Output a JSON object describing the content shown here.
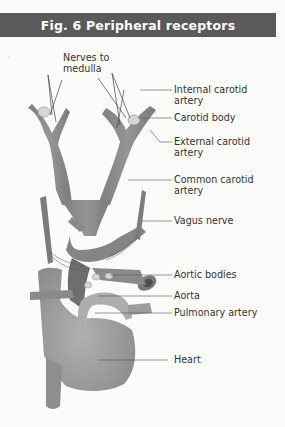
{
  "figure": {
    "title": "Fig. 6  Peripheral receptors"
  },
  "labels": {
    "nerves_to_medulla": "Nerves to\nmedulla",
    "internal_carotid": "Internal carotid\nartery",
    "carotid_body": "Carotid body",
    "external_carotid": "External carotid\nartery",
    "common_carotid": "Common carotid\nartery",
    "vagus_nerve": "Vagus nerve",
    "aortic_bodies": "Aortic bodies",
    "aorta": "Aorta",
    "pulmonary_artery": "Pulmonary artery",
    "heart": "Heart"
  },
  "colors": {
    "header_bg": "#5a5a5a",
    "vessel": "#8a8a8a",
    "heart": "#9c9c9c",
    "background": "#fbfbfa"
  }
}
